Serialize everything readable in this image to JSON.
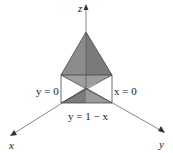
{
  "diagram": {
    "type": "3d-solid-region",
    "axes": {
      "x": "x",
      "y": "y",
      "z": "z"
    },
    "plane_labels": {
      "left": "y = 0",
      "right": "x = 0",
      "bottom": "y = 1 − x"
    },
    "colors": {
      "solid_fill": "#8a8a8a",
      "solid_dark": "#6e6e6e",
      "solid_light": "#b4b4b4",
      "axis": "#555555"
    }
  }
}
